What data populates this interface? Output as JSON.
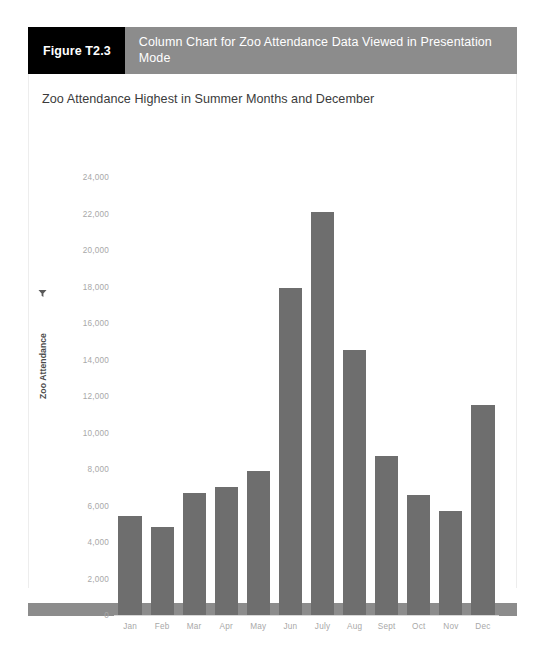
{
  "figure": {
    "number_label": "Figure T2.3",
    "caption": "Column Chart for Zoo Attendance Data Viewed in Presentation Mode"
  },
  "colors": {
    "header_bar": "#8c8c8c",
    "number_block": "#000000",
    "bar_fill": "#6e6e6e",
    "tick_text": "#a8a8a8",
    "title_text": "#3b3b3b",
    "footer_bar": "#8c8c8c"
  },
  "chart_data": {
    "type": "bar",
    "title": "Zoo Attendance Highest in Summer Months and December",
    "xlabel": "",
    "ylabel": "Zoo Attendance",
    "ylabel_icon": "filter-icon",
    "categories": [
      "Jan",
      "Feb",
      "Mar",
      "Apr",
      "May",
      "Jun",
      "July",
      "Aug",
      "Sept",
      "Oct",
      "Nov",
      "Dec"
    ],
    "values": [
      5400,
      4800,
      6700,
      7000,
      7900,
      17900,
      22100,
      14500,
      8700,
      6550,
      5700,
      11500
    ],
    "ylim": [
      0,
      24000
    ],
    "ytick_values": [
      0,
      2000,
      4000,
      6000,
      8000,
      10000,
      12000,
      14000,
      16000,
      18000,
      20000,
      22000,
      24000
    ],
    "ytick_labels": [
      "0",
      "2,000",
      "4,000",
      "6,000",
      "8,000",
      "10,000",
      "12,000",
      "14,000",
      "16,000",
      "18,000",
      "20,000",
      "22,000",
      "24,000"
    ],
    "grid": false,
    "legend": false
  }
}
